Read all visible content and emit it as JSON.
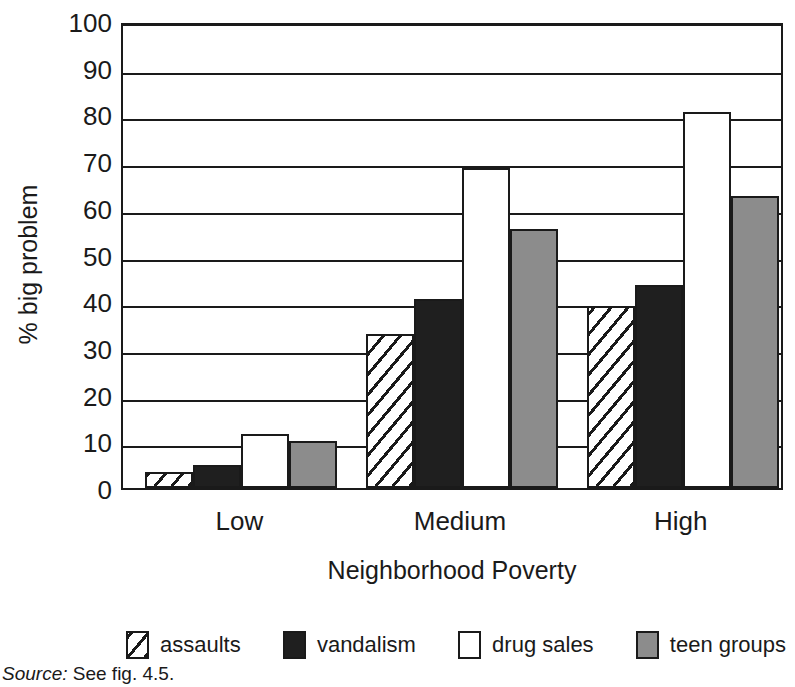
{
  "chart_data": {
    "type": "bar",
    "title": "",
    "xlabel": "Neighborhood Poverty",
    "ylabel": "% big problem",
    "ylim": [
      0,
      100
    ],
    "ytick_step": 10,
    "yticks": [
      100,
      90,
      80,
      70,
      60,
      50,
      40,
      30,
      20,
      10,
      0
    ],
    "categories": [
      "Low",
      "Medium",
      "High"
    ],
    "grid": "horizontal",
    "legend_position": "bottom",
    "series": [
      {
        "name": "assaults",
        "pattern": "diagonal-hatch",
        "color": "#ffffff",
        "values": [
          3.5,
          33,
          39
        ]
      },
      {
        "name": "vandalism",
        "pattern": "solid",
        "color": "#1f1f1f",
        "values": [
          5,
          40.5,
          43.5
        ]
      },
      {
        "name": "drug sales",
        "pattern": "solid",
        "color": "#ffffff",
        "values": [
          11.5,
          68.5,
          80.5
        ]
      },
      {
        "name": "teen groups",
        "pattern": "solid",
        "color": "#8c8c8c",
        "values": [
          10,
          55.5,
          62.5
        ]
      }
    ]
  },
  "axis": {
    "y_title": "% big problem",
    "x_title": "Neighborhood Poverty"
  },
  "legend": {
    "items": [
      {
        "label": "assaults"
      },
      {
        "label": "vandalism"
      },
      {
        "label": "drug sales"
      },
      {
        "label": "teen groups"
      }
    ]
  },
  "source": {
    "prefix": "Source:",
    "text": " See fig. 4.5."
  },
  "colors": {
    "axis": "#1a1a1a",
    "vandalism": "#1f1f1f",
    "teen_groups": "#8c8c8c",
    "drug_sales": "#ffffff",
    "background": "#ffffff"
  }
}
